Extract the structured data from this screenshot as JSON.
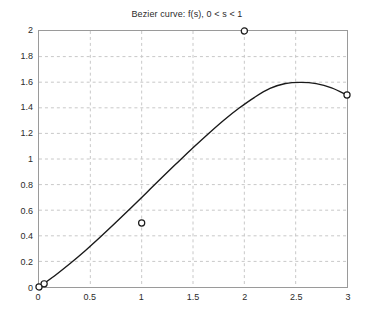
{
  "chart_data": {
    "type": "line",
    "title": "Bezier curve: f(s), 0 < s < 1",
    "xlabel": "",
    "ylabel": "",
    "xlim": [
      0,
      3
    ],
    "ylim": [
      0,
      2
    ],
    "grid": true,
    "legend": null,
    "xticks": [
      0,
      0.5,
      1,
      1.5,
      2,
      2.5,
      3
    ],
    "xtick_labels": [
      "0",
      "0.5",
      "1",
      "1.5",
      "2",
      "2.5",
      "3"
    ],
    "yticks": [
      0,
      0.2,
      0.4,
      0.6,
      0.8,
      1,
      1.2,
      1.4,
      1.6,
      1.8,
      2
    ],
    "ytick_labels": [
      "0",
      "0.2",
      "0.4",
      "0.6",
      "0.8",
      "1",
      "1.2",
      "1.4",
      "1.6",
      "1.8",
      "2"
    ],
    "series": [
      {
        "name": "Bezier curve f(s)",
        "type": "line",
        "color": "#1a1a1a",
        "linewidth": 1.4,
        "x": [
          0,
          0.15,
          0.3,
          0.45,
          0.6,
          0.75,
          0.9,
          1.05,
          1.2,
          1.35,
          1.5,
          1.65,
          1.8,
          1.95,
          2.1,
          2.25,
          2.4,
          2.55,
          2.7,
          2.85,
          3
        ],
        "y": [
          0,
          0.086,
          0.181,
          0.283,
          0.392,
          0.505,
          0.621,
          0.739,
          0.857,
          0.973,
          1.088,
          1.198,
          1.303,
          1.398,
          1.482,
          1.551,
          1.59,
          1.599,
          1.589,
          1.556,
          1.5
        ]
      },
      {
        "name": "Control points",
        "type": "scatter",
        "marker": "open-circle",
        "color": "#1a1a1a",
        "points": [
          {
            "x": 0,
            "y": 0,
            "label": "P0"
          },
          {
            "x": 1,
            "y": 0.5,
            "label": "P1"
          },
          {
            "x": 2,
            "y": 2,
            "label": "P2"
          },
          {
            "x": 3,
            "y": 1.5,
            "label": "P3"
          }
        ]
      },
      {
        "name": "Curve start point",
        "type": "scatter",
        "marker": "open-circle",
        "color": "#1a1a1a",
        "points": [
          {
            "x": 0.05,
            "y": 0.025,
            "label": "f(0)"
          }
        ]
      }
    ],
    "colors": {
      "curve": "#1a1a1a",
      "marker_edge": "#1a1a1a",
      "marker_face": "#ffffff",
      "grid": "#c8c8c8",
      "axis": "#9a9a9a",
      "text": "#2b2b2b",
      "background": "#ffffff"
    }
  }
}
